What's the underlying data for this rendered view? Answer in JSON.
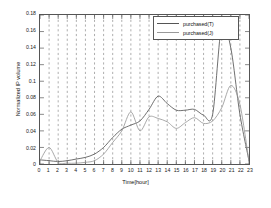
{
  "chart_data": {
    "type": "line",
    "title": "",
    "xlabel": "Time[hour]",
    "ylabel": "Normalized IP volume",
    "xlim": [
      0,
      23
    ],
    "ylim": [
      0,
      0.18
    ],
    "xticks": [
      0,
      1,
      2,
      3,
      4,
      5,
      6,
      7,
      8,
      9,
      10,
      11,
      12,
      13,
      14,
      15,
      16,
      17,
      18,
      19,
      20,
      21,
      22,
      23
    ],
    "xtick_labels": [
      "0",
      "1",
      "2",
      "3",
      "4",
      "5",
      "6",
      "7",
      "8",
      "9",
      "10",
      "11",
      "12",
      "13",
      "14",
      "15",
      "16",
      "17",
      "18",
      "19",
      "20",
      "21",
      "22",
      "23"
    ],
    "yticks": [
      0,
      0.02,
      0.04,
      0.06,
      0.08,
      0.1,
      0.12,
      0.14,
      0.16,
      0.18
    ],
    "ytick_labels": [
      "0",
      "0.02",
      "0.04",
      "0.06",
      "0.08",
      "0.1",
      "0.12",
      "0.14",
      "0.16",
      "0.18"
    ],
    "grid": "vertical-dashed",
    "legend_position": "top-right",
    "x": [
      0,
      1,
      2,
      3,
      4,
      5,
      6,
      7,
      8,
      9,
      10,
      11,
      12,
      13,
      14,
      15,
      16,
      17,
      18,
      19,
      20,
      21,
      22,
      23
    ],
    "series": [
      {
        "name": "purchased(T)",
        "color": "#555555",
        "values": [
          0.005,
          0.004,
          0.003,
          0.004,
          0.006,
          0.008,
          0.012,
          0.02,
          0.032,
          0.042,
          0.047,
          0.052,
          0.066,
          0.082,
          0.073,
          0.065,
          0.065,
          0.066,
          0.059,
          0.06,
          0.168,
          0.14,
          0.06,
          0.004
        ]
      },
      {
        "name": "purchased(J)",
        "color": "#999999",
        "values": [
          0.004,
          0.02,
          0.002,
          0.001,
          0.001,
          0.002,
          0.004,
          0.012,
          0.026,
          0.04,
          0.063,
          0.04,
          0.057,
          0.055,
          0.051,
          0.043,
          0.05,
          0.056,
          0.049,
          0.052,
          0.068,
          0.095,
          0.072,
          0.003
        ]
      }
    ]
  },
  "legend": {
    "items": [
      {
        "label": "purchased(T)"
      },
      {
        "label": "purchased(J)"
      }
    ]
  },
  "axes": {
    "x_axis_label": "Time[hour]",
    "y_axis_label": "Normalized IP volume"
  }
}
